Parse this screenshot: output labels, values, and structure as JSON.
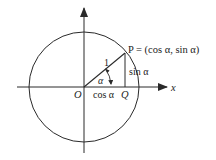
{
  "diagram": {
    "colors": {
      "stroke": "#2a2a2a",
      "text": "#222222",
      "background": "#ffffff"
    },
    "labels": {
      "origin": "O",
      "point_p": "P = (cos α, sin α)",
      "point_q": "Q",
      "x_axis": "x",
      "radius": "1",
      "angle": "α",
      "adjacent": "cos α",
      "opposite": "sin α"
    },
    "geometry": {
      "center": [
        84,
        87
      ],
      "radius": 55,
      "point_p": [
        125,
        53
      ],
      "point_q": [
        125,
        87
      ]
    }
  }
}
